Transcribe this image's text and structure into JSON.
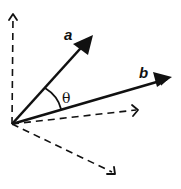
{
  "diagram": {
    "colors": {
      "stroke": "#111111",
      "background": "#ffffff"
    },
    "origin": {
      "x": 12,
      "y": 124
    },
    "vectors": [
      {
        "id": "a",
        "label": "a",
        "style": "solid",
        "tip": {
          "x": 93,
          "y": 35
        },
        "label_pos": {
          "x": 64,
          "y": 40
        }
      },
      {
        "id": "b",
        "label": "b",
        "style": "solid",
        "tip": {
          "x": 172,
          "y": 77
        },
        "label_pos": {
          "x": 139,
          "y": 78
        }
      }
    ],
    "axes": [
      {
        "id": "axis-up",
        "style": "dashed",
        "tip": {
          "x": 13,
          "y": 14
        }
      },
      {
        "id": "axis-right",
        "style": "dashed",
        "tip": {
          "x": 138,
          "y": 110
        }
      },
      {
        "id": "axis-down-right",
        "style": "dashed",
        "tip": {
          "x": 115,
          "y": 174
        }
      }
    ],
    "angle": {
      "label": "θ",
      "between": [
        "a",
        "b"
      ],
      "label_pos": {
        "x": 62,
        "y": 103
      }
    }
  }
}
